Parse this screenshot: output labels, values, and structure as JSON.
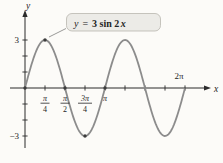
{
  "axes": {
    "x_label": "x",
    "y_label": "y",
    "y_max_label": "3",
    "y_min_label": "−3",
    "x_end_label": "2π"
  },
  "callout": {
    "var_y": "y",
    "eq": "=",
    "coef": "3 sin 2",
    "var_x": "x"
  },
  "chart_data": {
    "type": "line",
    "function": {
      "expression": "y = 3 sin 2x",
      "amplitude": 3,
      "angular_coefficient": 2,
      "period": "π"
    },
    "x_range_numeric": [
      0,
      6.2832
    ],
    "ylim": [
      -3,
      3
    ],
    "x_ticks": [
      {
        "label": "π/4",
        "num": "π",
        "den": "4",
        "value": 0.7854
      },
      {
        "label": "π/2",
        "num": "π",
        "den": "2",
        "value": 1.5708
      },
      {
        "label": "3π/4",
        "num": "3π",
        "den": "4",
        "value": 2.3562
      },
      {
        "label": "π",
        "num": "π",
        "den": null,
        "value": 3.1416
      },
      {
        "label": "5π/4",
        "num": null,
        "den": null,
        "value": 3.927
      },
      {
        "label": "3π/2",
        "num": null,
        "den": null,
        "value": 4.7124
      },
      {
        "label": "7π/4",
        "num": null,
        "den": null,
        "value": 5.4978
      },
      {
        "label": "2π",
        "num": null,
        "den": null,
        "value": 6.2832
      }
    ],
    "y_ticks": [
      -3,
      -2,
      -1,
      1,
      2,
      3
    ],
    "key_points": [
      [
        0,
        0
      ],
      [
        0.7854,
        3
      ],
      [
        1.5708,
        0
      ],
      [
        2.3562,
        -3
      ],
      [
        3.1416,
        0
      ]
    ],
    "colors": {
      "curve": "#8c8c8c",
      "axis": "#2b2b2b",
      "key_point": "#3c3c3c"
    },
    "legend": "none",
    "grid": false
  }
}
